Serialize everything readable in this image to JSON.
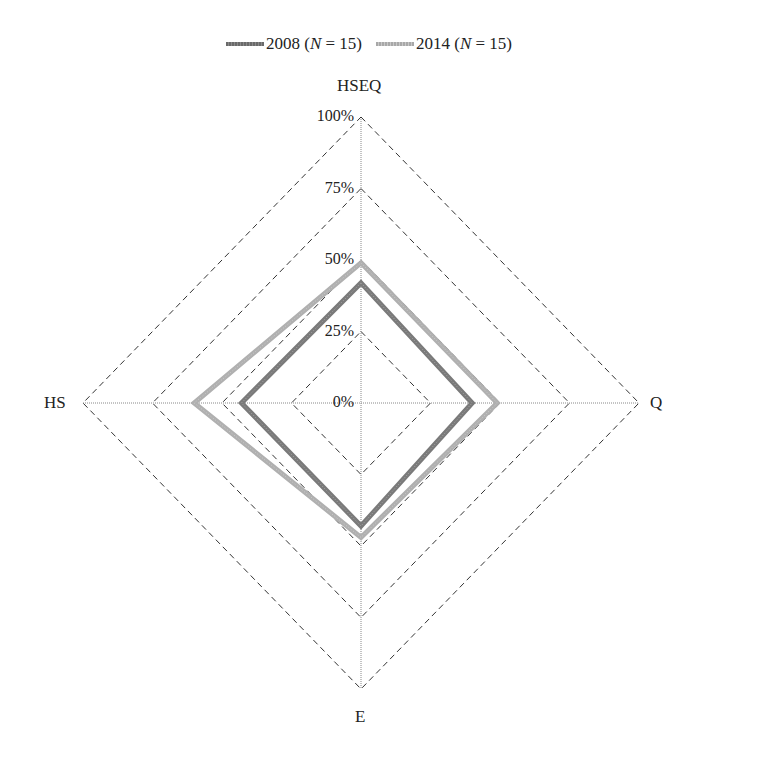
{
  "chart_data": {
    "type": "radar",
    "title": "",
    "axes": [
      "HSEQ",
      "Q",
      "E",
      "HS"
    ],
    "tick_labels": [
      "0%",
      "25%",
      "50%",
      "75%",
      "100%"
    ],
    "range": [
      0,
      100
    ],
    "grid": "dashed diamonds",
    "legend_position": "top",
    "series": [
      {
        "name": "2008 (N = 15)",
        "year": "2008",
        "n_label": "N",
        "n": "15",
        "color": "#7a7a7a",
        "values": [
          42,
          40,
          43,
          43
        ]
      },
      {
        "name": "2014 (N = 15)",
        "year": "2014",
        "n_label": "N",
        "n": "15",
        "color": "#b0b0b0",
        "values": [
          49,
          49,
          47,
          60
        ]
      }
    ]
  },
  "legend": {
    "items": [
      {
        "prefix": "2008 (",
        "n": "N",
        "suffix": " = 15)"
      },
      {
        "prefix": "2014 (",
        "n": "N",
        "suffix": " = 15)"
      }
    ]
  },
  "labels": {
    "top": "HSEQ",
    "right": "Q",
    "bottom": "E",
    "left": "HS"
  },
  "ticks": [
    "0%",
    "25%",
    "50%",
    "75%",
    "100%"
  ]
}
